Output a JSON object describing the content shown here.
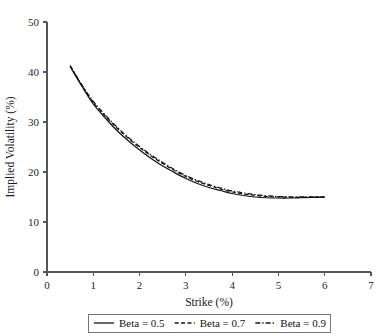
{
  "chart_data": {
    "type": "line",
    "title": "",
    "xlabel": "Strike (%)",
    "ylabel": "Implied Volatility (%)",
    "xlim": [
      0,
      7
    ],
    "ylim": [
      0,
      50
    ],
    "xticks": [
      0,
      1,
      2,
      3,
      4,
      5,
      6,
      7
    ],
    "yticks": [
      0,
      10,
      20,
      30,
      40,
      50
    ],
    "xticklabels": [
      "0",
      "1",
      "2",
      "3",
      "4",
      "5",
      "6",
      "7"
    ],
    "yticklabels": [
      "0",
      "10",
      "20",
      "30",
      "40",
      "50"
    ],
    "grid": false,
    "legend_position": "below-axes",
    "line_color": "#141414",
    "x": [
      0.5,
      0.75,
      1.0,
      1.25,
      1.5,
      1.75,
      2.0,
      2.25,
      2.5,
      2.75,
      3.0,
      3.25,
      3.5,
      3.75,
      4.0,
      4.25,
      4.5,
      4.75,
      5.0,
      5.25,
      5.5,
      5.75,
      6.0
    ],
    "series": [
      {
        "name": "Beta = 0.5",
        "dash": "solid",
        "values": [
          41.1,
          37.2,
          33.6,
          30.9,
          28.4,
          26.3,
          24.4,
          22.7,
          21.2,
          19.9,
          18.7,
          17.7,
          16.9,
          16.3,
          15.7,
          15.3,
          15.0,
          14.85,
          14.8,
          14.8,
          14.85,
          14.9,
          14.95
        ]
      },
      {
        "name": "Beta = 0.7",
        "dash": "dashed",
        "values": [
          41.2,
          37.4,
          33.9,
          31.3,
          28.9,
          26.8,
          24.9,
          23.2,
          21.7,
          20.3,
          19.1,
          18.1,
          17.3,
          16.6,
          16.0,
          15.6,
          15.3,
          15.1,
          15.0,
          14.95,
          14.95,
          15.0,
          15.0
        ]
      },
      {
        "name": "Beta = 0.9",
        "dash": "dashdot",
        "values": [
          41.3,
          37.5,
          34.1,
          31.5,
          29.1,
          27.0,
          25.1,
          23.4,
          21.9,
          20.5,
          19.3,
          18.3,
          17.5,
          16.8,
          16.2,
          15.8,
          15.5,
          15.25,
          15.1,
          15.05,
          15.05,
          15.05,
          15.05
        ]
      }
    ]
  },
  "legend": {
    "entries": [
      {
        "label": "Beta = 0.5",
        "style": "solid"
      },
      {
        "label": "Beta = 0.7",
        "style": "dashed"
      },
      {
        "label": "Beta = 0.9",
        "style": "dashdot"
      }
    ]
  }
}
